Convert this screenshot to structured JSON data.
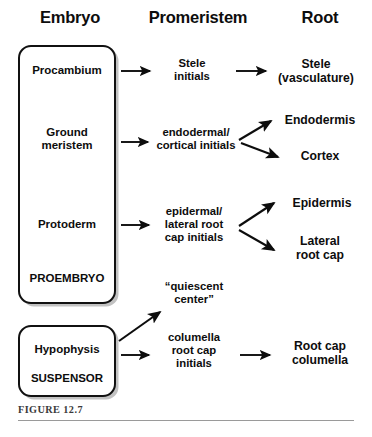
{
  "figure": {
    "caption": "FIGURE 12.7",
    "rule_color": "#9a9a9a",
    "background": "#ffffff",
    "ink_color": "#0d0d0d"
  },
  "headers": [
    {
      "label": "Embryo",
      "x": 22,
      "width": 96
    },
    {
      "label": "Promeristem",
      "x": 138,
      "width": 120
    },
    {
      "label": "Root",
      "x": 278,
      "width": 84
    }
  ],
  "boxes": [
    {
      "name": "proembryo-box",
      "labels": [
        "Procambium",
        "Ground meristem",
        "Protoderm",
        "PROEMBRYO"
      ]
    },
    {
      "name": "suspensor-box",
      "labels": [
        "Hypophysis",
        "SUSPENSOR"
      ]
    }
  ],
  "embryo_column": {
    "procambium": "Procambium",
    "ground_meristem_line1": "Ground",
    "ground_meristem_line2": "meristem",
    "protoderm": "Protoderm",
    "proembryo": "PROEMBRYO",
    "hypophysis": "Hypophysis",
    "suspensor": "SUSPENSOR"
  },
  "promeristem_column": {
    "stele_initials_line1": "Stele",
    "stele_initials_line2": "initials",
    "endodermal_line1": "endodermal/",
    "endodermal_line2": "cortical initials",
    "epidermal_line1": "epidermal/",
    "epidermal_line2": "lateral root",
    "epidermal_line3": "cap initials",
    "quiescent_line1": "“quiescent",
    "quiescent_line2": "center”",
    "columella_line1": "columella",
    "columella_line2": "root cap",
    "columella_line3": "initials"
  },
  "root_column": {
    "stele_line1": "Stele",
    "stele_line2": "(vasculature)",
    "endodermis": "Endodermis",
    "cortex": "Cortex",
    "epidermis": "Epidermis",
    "lateral_root_cap_line1": "Lateral",
    "lateral_root_cap_line2": "root cap",
    "root_cap_columella_line1": "Root cap",
    "root_cap_columella_line2": "columella"
  },
  "arrows": [
    {
      "name": "arrow-procambium-to-stele-initials",
      "from": "Procambium",
      "to": "Stele initials"
    },
    {
      "name": "arrow-stele-initials-to-stele",
      "from": "Stele initials",
      "to": "Stele (vasculature)"
    },
    {
      "name": "arrow-ground-meristem-to-endodermal",
      "from": "Ground meristem",
      "to": "endodermal/cortical initials"
    },
    {
      "name": "arrow-endodermal-to-endodermis",
      "from": "endodermal/cortical initials",
      "to": "Endodermis"
    },
    {
      "name": "arrow-endodermal-to-cortex",
      "from": "endodermal/cortical initials",
      "to": "Cortex"
    },
    {
      "name": "arrow-protoderm-to-epidermal",
      "from": "Protoderm",
      "to": "epidermal/lateral root cap initials"
    },
    {
      "name": "arrow-epidermal-to-epidermis",
      "from": "epidermal/lateral root cap initials",
      "to": "Epidermis"
    },
    {
      "name": "arrow-epidermal-to-lateral-root-cap",
      "from": "epidermal/lateral root cap initials",
      "to": "Lateral root cap"
    },
    {
      "name": "arrow-hypophysis-to-quiescent-center",
      "from": "Hypophysis",
      "to": "“quiescent center”"
    },
    {
      "name": "arrow-hypophysis-to-columella-initials",
      "from": "Hypophysis",
      "to": "columella root cap initials"
    },
    {
      "name": "arrow-columella-initials-to-root-cap",
      "from": "columella root cap initials",
      "to": "Root cap columella"
    }
  ]
}
